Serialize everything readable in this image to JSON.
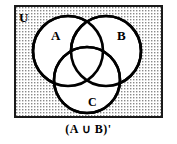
{
  "figure": {
    "type": "venn-diagram",
    "universe_label": "U",
    "caption": "(A ∪ B)'",
    "colors": {
      "border": "#1a1a1a",
      "circle_stroke": "#000000",
      "circle_fill": "#ffffff",
      "shading": "#8a8a8a",
      "background": "#ffffff"
    },
    "shaded_region_description": "Region inside the universal set U but outside circles A, B and C (stippled dot pattern)"
  },
  "sets": [
    {
      "id": "A",
      "label": "A",
      "position": "upper-left"
    },
    {
      "id": "B",
      "label": "B",
      "position": "upper-right"
    },
    {
      "id": "C",
      "label": "C",
      "position": "bottom-center"
    }
  ],
  "geometry": {
    "rect": {
      "x": 14,
      "y": 5,
      "width": 149,
      "height": 113
    },
    "circles": [
      {
        "id": "A",
        "cx": 68,
        "cy": 51,
        "r": 35
      },
      {
        "id": "B",
        "cx": 106,
        "cy": 51,
        "r": 35
      },
      {
        "id": "C",
        "cx": 87,
        "cy": 80,
        "r": 33
      }
    ]
  }
}
